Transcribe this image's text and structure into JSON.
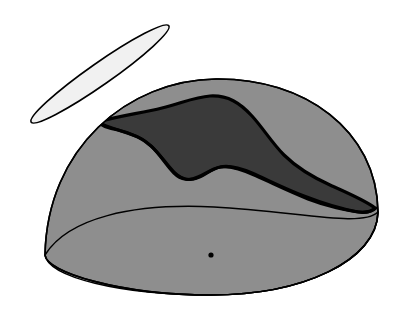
{
  "figure": {
    "background_color": "#ffffff",
    "width": 406,
    "height": 314,
    "caption": ""
  },
  "palette": {
    "outline": "#000000",
    "dome_fill": "#8e8e8e",
    "dome_fill_lower": "#8d8d8d",
    "shaded_band_fill": "#3a3a3a",
    "disc_fill": "#f1f1f1",
    "center_dot": "#000000",
    "page_background": "#ffffff"
  },
  "elements": {
    "dome": {
      "name": "hemisphere-dome",
      "label": "Hemisphere",
      "fill": "#8e8e8e",
      "stroke": "#000000",
      "stroke_width": 1.6,
      "apex": {
        "x": 215,
        "y": 79
      },
      "left_base": {
        "x": 45,
        "y": 255
      },
      "right_base": {
        "x": 378,
        "y": 212
      },
      "base_bottom_y": 295,
      "outline_path": "M 45 255 C 47 148 128 80 216 79 C 304 78 377 130 378 212 L 378 212 C 377 261 302 295 211 295 C 120 295 46 272 45 255 Z",
      "silhouette_arc_path": "M 45 255 C 47 148 128 80 216 79 C 304 78 377 130 378 212"
    },
    "base_rim": {
      "name": "dome-base-rim-ellipse",
      "label": "Base rim ellipse",
      "stroke": "#000000",
      "stroke_width": 1.5,
      "fill": "none",
      "back_arc_path": "M 45 255 C 68 218 132 203 214 207 C 296 211 362 228 378 212",
      "front_arc_path": "M 45 255 C 48 277 120 295 211 295 C 302 295 377 261 378 212"
    },
    "shaded_band": {
      "name": "shaded-cap-band",
      "label": "Shaded cap region",
      "fill": "#3a3a3a",
      "stroke": "#000000",
      "stroke_width": 3.2,
      "path": "M 98 122 C 118 116 142 113 162 108 C 182 103 195 97 210 96 C 228 95 240 103 252 116 C 263 128 272 143 284 155 C 296 167 312 177 332 186 C 350 194 366 201 375 208 C 372 211 366 213 358 212 C 341 209 322 203 304 196 C 283 188 266 179 252 173 C 238 167 228 165 220 167 C 211 169 205 174 198 177 C 190 181 181 180 174 173 C 166 165 160 154 151 146 C 142 138 131 133 118 130 C 108 128 101 126 98 122 Z"
    },
    "shaded_band_highlight": {
      "name": "shaded-cap-inner-edge",
      "label": "Cap lower boundary",
      "stroke": "#000000",
      "stroke_width": 3.0,
      "fill": "none",
      "path": "M 98 122 C 108 128 131 133 142 139 C 156 147 164 162 174 172 C 183 181 192 181 200 177 C 208 173 213 168 221 167 C 231 166 243 170 256 176 C 272 183 290 192 308 199 C 326 206 348 211 360 212 C 368 213 373 211 376 208"
    },
    "disc": {
      "name": "elliptical-disc",
      "label": "Detached elliptical disc",
      "fill": "#f1f1f1",
      "stroke": "#000000",
      "stroke_width": 1.6,
      "center": {
        "x": 100,
        "y": 74
      },
      "radius_major": 84,
      "radius_minor": 11,
      "rotation_degrees": -35
    },
    "center_dot": {
      "name": "dome-center-point",
      "label": "Center point",
      "fill": "#000000",
      "x": 211,
      "y": 255,
      "radius": 2.6
    }
  },
  "annotations": []
}
